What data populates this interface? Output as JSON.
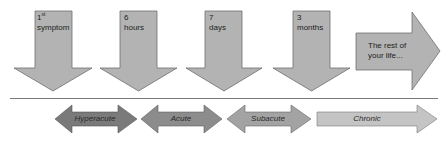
{
  "timepoints": [
    {
      "number": "1",
      "superscript": "st",
      "unit": "symptom"
    },
    {
      "number": "6",
      "superscript": "",
      "unit": "hours"
    },
    {
      "number": "7",
      "superscript": "",
      "unit": "days"
    },
    {
      "number": "3",
      "superscript": "",
      "unit": "months"
    }
  ],
  "final_stage": {
    "line1": "The rest of",
    "line2": "your life..."
  },
  "phases": [
    {
      "label": "Hyperacute",
      "color": "#7a7a7a"
    },
    {
      "label": "Acute",
      "color": "#8c8c8c"
    },
    {
      "label": "Subacute",
      "color": "#a3a3a3"
    },
    {
      "label": "Chronic",
      "color": "#c4c4c4"
    }
  ],
  "colors": {
    "timepoint_arrow_fill": "#b3b3b3",
    "arrow_stroke": "#6e6e6e",
    "separator": "#7a7a7a"
  }
}
